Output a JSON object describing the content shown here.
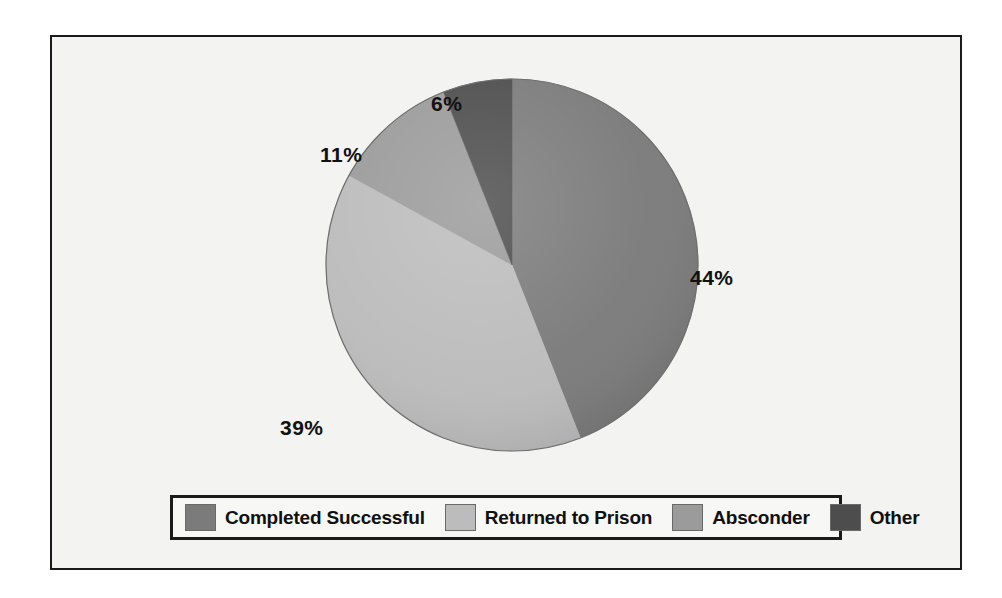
{
  "chart_data": {
    "type": "pie",
    "title": "",
    "subtitle": "",
    "xlabel": "",
    "ylabel": "",
    "legend_position": "bottom",
    "grid": false,
    "start_angle_deg": 0,
    "direction": "clockwise",
    "categories": [
      "Completed Successful",
      "Returned to Prison",
      "Absconder",
      "Other"
    ],
    "values": [
      44,
      39,
      11,
      6
    ],
    "labels": [
      "44%",
      "39%",
      "11%",
      "6%"
    ],
    "colors": [
      "#7b7b7b",
      "#bcbcbc",
      "#9b9b9b",
      "#4d4d4d"
    ],
    "slices": [
      {
        "name": "Completed Successful",
        "value": 44,
        "label": "44%",
        "color": "#7b7b7b"
      },
      {
        "name": "Returned to Prison",
        "value": 39,
        "label": "39%",
        "color": "#bcbcbc"
      },
      {
        "name": "Absconder",
        "value": 11,
        "label": "11%",
        "color": "#9b9b9b"
      },
      {
        "name": "Other",
        "value": 6,
        "label": "6%",
        "color": "#4d4d4d"
      }
    ]
  },
  "legend": {
    "items": [
      {
        "label": "Completed Successful",
        "color": "#7b7b7b"
      },
      {
        "label": "Returned to Prison",
        "color": "#bcbcbc"
      },
      {
        "label": "Absconder",
        "color": "#9b9b9b"
      },
      {
        "label": "Other",
        "color": "#4d4d4d"
      }
    ]
  },
  "colors": {
    "frame_border": "#1a1a1a",
    "frame_background": "#f3f3f1",
    "legend_border": "#1a1a1a",
    "legend_background": "#f7f7f6",
    "label_text": "#111111"
  }
}
